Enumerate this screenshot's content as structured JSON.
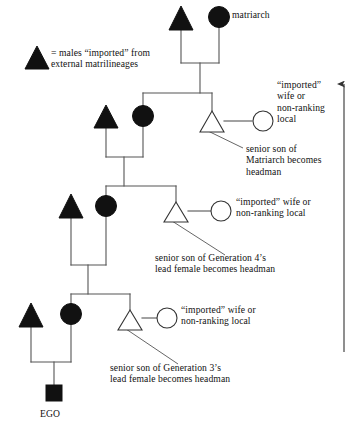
{
  "figure": {
    "background_color": "#ffffff",
    "ink_color": "#111111",
    "line_color": "#555555"
  },
  "legend": {
    "symbol": "filled-triangle",
    "text": "= males “imported” from\n   external matrilineages"
  },
  "labels": {
    "matriarch": "matriarch",
    "ego": "EGO",
    "wife_gen4": "“imported”\nwife or\nnon-ranking\nlocal",
    "wife_gen3": "“imported” wife or\nnon-ranking local",
    "wife_gen2": "“imported” wife or\nnon-ranking local",
    "headman_gen4": "senior son of\nMatriarch becomes\nheadman",
    "headman_gen3": "senior son of Generation 4’s\nlead female becomes headman",
    "headman_gen2": "senior son of Generation 3’s\nlead female becomes headman"
  },
  "symbols": {
    "filled_triangle": "imported male",
    "filled_circle": "lineage female",
    "hollow_triangle": "headman son",
    "hollow_circle": "imported or non-ranking wife",
    "filled_square": "ego"
  },
  "generations": [
    {
      "name": "generation-5",
      "imported_male": {
        "shape": "triangle",
        "fill": "solid",
        "cx": 181,
        "cy": 18
      },
      "lineage_female": {
        "shape": "circle",
        "fill": "solid",
        "cx": 219,
        "cy": 17
      }
    },
    {
      "name": "generation-4",
      "imported_male": {
        "shape": "triangle",
        "fill": "solid",
        "cx": 106,
        "cy": 117
      },
      "lineage_female": {
        "shape": "circle",
        "fill": "solid",
        "cx": 143,
        "cy": 116
      },
      "headman_son": {
        "shape": "triangle",
        "fill": "hollow",
        "cx": 212,
        "cy": 122
      },
      "wife": {
        "shape": "circle",
        "fill": "hollow",
        "cx": 263,
        "cy": 120
      }
    },
    {
      "name": "generation-3",
      "imported_male": {
        "shape": "triangle",
        "fill": "solid",
        "cx": 71,
        "cy": 206
      },
      "lineage_female": {
        "shape": "circle",
        "fill": "solid",
        "cx": 106,
        "cy": 206
      },
      "headman_son": {
        "shape": "triangle",
        "fill": "hollow",
        "cx": 176,
        "cy": 212
      },
      "wife": {
        "shape": "circle",
        "fill": "hollow",
        "cx": 221,
        "cy": 209
      }
    },
    {
      "name": "generation-2",
      "imported_male": {
        "shape": "triangle",
        "fill": "solid",
        "cx": 31,
        "cy": 315
      },
      "lineage_female": {
        "shape": "circle",
        "fill": "solid",
        "cx": 71,
        "cy": 314
      },
      "headman_son": {
        "shape": "triangle",
        "fill": "hollow",
        "cx": 130,
        "cy": 320
      },
      "wife": {
        "shape": "circle",
        "fill": "hollow",
        "cx": 167,
        "cy": 317
      }
    },
    {
      "name": "generation-1",
      "ego": {
        "shape": "square",
        "fill": "solid",
        "cx": 54,
        "cy": 392
      }
    }
  ],
  "time_axis": {
    "name": "generations-arrow",
    "direction": "up",
    "x": 344,
    "y_top": 80,
    "y_bottom": 352
  }
}
